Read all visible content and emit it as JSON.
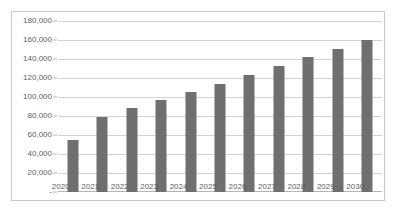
{
  "chart_data": {
    "type": "bar",
    "title": "",
    "subtitle": "",
    "xlabel": "",
    "ylabel": "",
    "categories": [
      "2020",
      "2021",
      "2022",
      "2023",
      "2024",
      "2025",
      "2026",
      "2027",
      "2028",
      "2029",
      "2030"
    ],
    "values": [
      55000,
      79000,
      88000,
      97000,
      105000,
      114000,
      123000,
      133000,
      142000,
      151000,
      160000
    ],
    "series": [
      {
        "name": "",
        "values": [
          55000,
          79000,
          88000,
          97000,
          105000,
          114000,
          123000,
          133000,
          142000,
          151000,
          160000
        ]
      }
    ],
    "ylim": [
      0,
      180000
    ],
    "y_ticks": [
      0,
      20000,
      40000,
      60000,
      80000,
      100000,
      120000,
      140000,
      160000,
      180000
    ],
    "y_tick_labels": [
      "-",
      "20,000",
      "40,000",
      "60,000",
      "80,000",
      "100,000",
      "120,000",
      "140,000",
      "160,000",
      "180,000"
    ],
    "grid": true,
    "legend": false,
    "legend_position": "none",
    "bar_color": "#6f6f6f",
    "gridline_color": "#d2d2d2",
    "axis_color": "#b4b4b4",
    "plot_background": "#ffffff",
    "frame_border_color": "#c9c9c9",
    "annotations": []
  },
  "caption": {
    "text": ""
  }
}
